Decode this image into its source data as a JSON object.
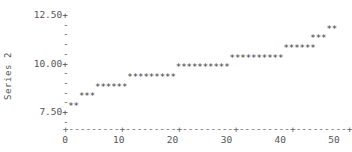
{
  "chart_data": {
    "type": "scatter",
    "title": "",
    "xlabel": "",
    "ylabel": "Series 2",
    "marker": "*",
    "xlim": [
      0,
      51
    ],
    "ylim": [
      7.2,
      12.8
    ],
    "grid": false,
    "legend": "none",
    "y_axis": {
      "ticks": [
        {
          "value": 12.5,
          "label": "12.50+"
        },
        {
          "value": 10.0,
          "label": "10.00+"
        },
        {
          "value": 7.5,
          "label": "7.50+"
        }
      ],
      "minor_tick_glyph": "-",
      "minor_tick_count_between": 4
    },
    "x_axis": {
      "ticks": [
        0,
        10,
        20,
        30,
        40,
        50
      ],
      "tick_labels": [
        "0",
        "10",
        "20",
        "30",
        "40",
        "50"
      ],
      "axis_glyph": "+",
      "axis_fill_glyph": "-"
    },
    "steps": [
      {
        "y": 7.75,
        "x_start": 1,
        "count": 2
      },
      {
        "y": 8.25,
        "x_start": 3,
        "count": 3
      },
      {
        "y": 8.75,
        "x_start": 6,
        "count": 6
      },
      {
        "y": 9.25,
        "x_start": 12,
        "count": 9
      },
      {
        "y": 9.75,
        "x_start": 21,
        "count": 10
      },
      {
        "y": 10.25,
        "x_start": 31,
        "count": 10
      },
      {
        "y": 10.75,
        "x_start": 41,
        "count": 6
      },
      {
        "y": 11.25,
        "x_start": 46,
        "count": 3
      },
      {
        "y": 11.75,
        "x_start": 49,
        "count": 2
      }
    ],
    "x": [
      1,
      2,
      3,
      4,
      5,
      6,
      7,
      8,
      9,
      10,
      11,
      12,
      13,
      14,
      15,
      16,
      17,
      18,
      19,
      20,
      21,
      22,
      23,
      24,
      25,
      26,
      27,
      28,
      29,
      30,
      31,
      32,
      33,
      34,
      35,
      36,
      37,
      38,
      39,
      40,
      41,
      42,
      43,
      44,
      45,
      46,
      47,
      48,
      49,
      50
    ],
    "y": [
      7.75,
      7.75,
      8.25,
      8.25,
      8.25,
      8.75,
      8.75,
      8.75,
      8.75,
      8.75,
      8.75,
      9.25,
      9.25,
      9.25,
      9.25,
      9.25,
      9.25,
      9.25,
      9.25,
      9.25,
      9.75,
      9.75,
      9.75,
      9.75,
      9.75,
      9.75,
      9.75,
      9.75,
      9.75,
      9.75,
      10.25,
      10.25,
      10.25,
      10.25,
      10.25,
      10.25,
      10.25,
      10.25,
      10.25,
      10.25,
      10.75,
      10.75,
      10.75,
      10.75,
      10.75,
      11.25,
      11.25,
      11.25,
      11.75,
      11.75
    ]
  },
  "colors": {
    "marker": "#3a3a3a",
    "axis": "#666666",
    "text": "#555555",
    "background": "#ffffff"
  }
}
